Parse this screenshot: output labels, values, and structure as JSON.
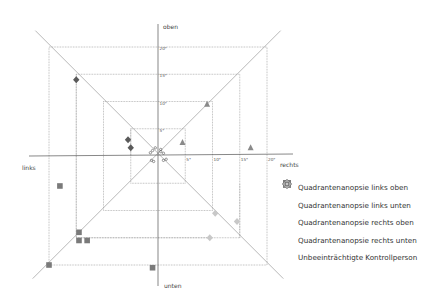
{
  "chart_data": {
    "type": "scatter",
    "title": "",
    "axis_labels": {
      "top": "oben",
      "bottom": "unten",
      "left": "links",
      "right": "rechts"
    },
    "rings_deg": [
      5,
      10,
      15,
      20
    ],
    "x_tick_labels": [
      "5°",
      "10°",
      "15°",
      "20°"
    ],
    "y_tick_labels": [
      "5°",
      "10°",
      "15°",
      "20°"
    ],
    "grid": "concentric squares with diagonal lines",
    "legend_position": "right-bottom",
    "series": [
      {
        "name": "Quadrantenanopsie links oben",
        "marker": "diamond",
        "color": "#5a5a5a",
        "points": [
          [
            -15,
            14
          ],
          [
            -5.5,
            3
          ],
          [
            -5,
            1.5
          ]
        ]
      },
      {
        "name": "Quadrantenanopsie links unten",
        "marker": "square",
        "color": "#7a7a7a",
        "points": [
          [
            -18,
            -5.5
          ],
          [
            -14.5,
            -14
          ],
          [
            -14.5,
            -15.5
          ],
          [
            -13,
            -15.5
          ],
          [
            -20,
            -20
          ],
          [
            -1,
            -20.5
          ]
        ]
      },
      {
        "name": "Quadrantenanopsie rechts oben",
        "marker": "triangle",
        "color": "#8a8a8a",
        "points": [
          [
            9,
            9.5
          ],
          [
            4.5,
            2.5
          ],
          [
            17,
            1.5
          ]
        ]
      },
      {
        "name": "Quadrantenanopsie rechts unten",
        "marker": "diamond",
        "color": "#c8c8c8",
        "points": [
          [
            10.5,
            -10.5
          ],
          [
            9.5,
            -15
          ],
          [
            14.5,
            -12
          ]
        ]
      },
      {
        "name": "Unbeeinträchtigte Kontrollperson",
        "marker": "circle-open",
        "color": "#555555",
        "points": [
          [
            -1,
            1
          ],
          [
            -0.5,
            1.5
          ],
          [
            0.5,
            0.8
          ],
          [
            1,
            0.5
          ],
          [
            -1.2,
            -0.8
          ],
          [
            -0.8,
            -1
          ],
          [
            1,
            -0.8
          ],
          [
            1.5,
            -0.6
          ],
          [
            0.5,
            1.2
          ],
          [
            -1.4,
            0.6
          ]
        ]
      }
    ]
  },
  "legend": {
    "items": [
      {
        "label": "Quadrantenanopsie links oben"
      },
      {
        "label": "Quadrantenanopsie links unten"
      },
      {
        "label": "Quadrantenanopsie rechts oben"
      },
      {
        "label": "Quadrantenanopsie rechts unten"
      },
      {
        "label": "Unbeeinträchtigte Kontrollperson"
      }
    ]
  }
}
